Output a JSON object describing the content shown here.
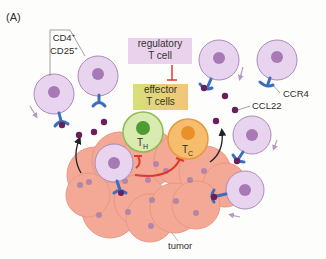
{
  "panel_label": "(A)",
  "labels": {
    "cd4": "CD4",
    "cd4_sup": "+",
    "cd25": "CD25",
    "cd25_sup": "+",
    "ccr4": "CCR4",
    "ccl22": "CCL22",
    "tumor": "tumor",
    "th": "T",
    "th_sub": "H",
    "tc": "T",
    "tc_sub": "C"
  },
  "boxes": {
    "regulatory": {
      "line1": "regulatory",
      "line2": "T cell",
      "color": "#ead2ec"
    },
    "effector": {
      "line1": "effector",
      "line2": "T cells",
      "color": "#f0d27a"
    }
  },
  "colors": {
    "treg_cell": "#e8d4ee",
    "treg_border": "#a98bb8",
    "treg_nucleus": "#a77ab6",
    "tumor_cell": "#f4a896",
    "tumor_border": "#e99883",
    "tumor_nucleus": "#a980a8",
    "receptor": "#3a6fc0",
    "chemokine": "#6b1e5c",
    "inhibit": "#e0392f",
    "th_cell": "#d9ebb0",
    "th_border": "#8cbc4f",
    "th_nucleus": "#4f9a32",
    "tc_cell": "#f6bd6f",
    "tc_border": "#e59a3a",
    "tc_nucleus": "#e9902a"
  }
}
